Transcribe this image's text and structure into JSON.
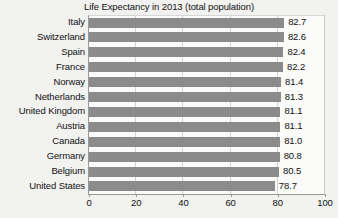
{
  "chart_data": {
    "type": "bar",
    "orientation": "horizontal",
    "title": "Life Expectancy in 2013 (total population)",
    "xlabel": "",
    "ylabel": "",
    "xlim": [
      0,
      100
    ],
    "xticks": [
      0,
      20,
      40,
      60,
      80,
      100
    ],
    "grid": true,
    "legend": false,
    "bar_color": "#8b8b8b",
    "background_color": "#f2f2f0",
    "plot_background_color": "#fbfbfa",
    "show_value_labels": true,
    "categories": [
      "Italy",
      "Switzerland",
      "Spain",
      "France",
      "Norway",
      "Netherlands",
      "United Kingdom",
      "Austria",
      "Canada",
      "Germany",
      "Belgium",
      "United States"
    ],
    "values": [
      82.7,
      82.6,
      82.4,
      82.2,
      81.4,
      81.3,
      81.1,
      81.1,
      81.0,
      80.8,
      80.5,
      78.7
    ],
    "value_labels": [
      "82.7",
      "82.6",
      "82.4",
      "82.2",
      "81.4",
      "81.3",
      "81.1",
      "81.1",
      "81.0",
      "80.8",
      "80.5",
      "78.7"
    ]
  }
}
